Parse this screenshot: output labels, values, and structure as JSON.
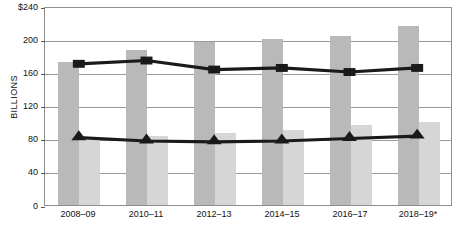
{
  "chart_data": {
    "type": "bar",
    "title": "",
    "subtitle": "",
    "xlabel": "",
    "ylabel": "BILLIONS",
    "ylim": [
      0,
      240
    ],
    "ytick_values": [
      0,
      40,
      80,
      120,
      160,
      200,
      240
    ],
    "ytick_labels": [
      "0",
      "40",
      "80",
      "120",
      "160",
      "200",
      "$240"
    ],
    "grid": "horizontal",
    "legend": "none",
    "categories": [
      "2008–09",
      "2010–11",
      "2012–13",
      "2014–15",
      "2016–17",
      "2018–19*"
    ],
    "series": [
      {
        "name": "bar-series-1",
        "kind": "bar",
        "color": "#b9b9b9",
        "values": [
          172,
          187,
          196,
          200,
          204,
          216
        ]
      },
      {
        "name": "bar-series-2",
        "kind": "bar",
        "color": "#d6d6d6",
        "values": [
          78,
          83,
          87,
          91,
          97,
          100
        ]
      },
      {
        "name": "line-series-1",
        "kind": "line",
        "marker": "square",
        "color": "#1a1a1a",
        "values": [
          172,
          176,
          165,
          167,
          162,
          167
        ]
      },
      {
        "name": "line-series-2",
        "kind": "line",
        "marker": "triangle",
        "color": "#1a1a1a",
        "values": [
          82,
          78,
          77,
          78,
          81,
          84
        ]
      }
    ],
    "footnote": "*"
  },
  "colors": {
    "bar_dark": "#b9b9b9",
    "bar_light": "#d6d6d6",
    "line": "#1a1a1a",
    "grid": "#9a9a9a",
    "axis": "#8f8f8f",
    "background": "#ffffff"
  }
}
